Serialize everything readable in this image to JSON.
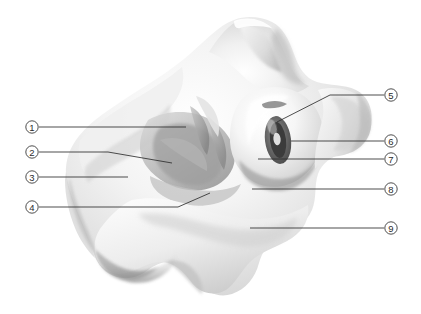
{
  "figure": {
    "background_color": "#ffffff",
    "specimen_tint_light": "#fdfdfd",
    "specimen_tint_mid": "#dcdcdc",
    "specimen_tint_dark": "#9a9a9a",
    "specimen_tint_deep": "#6b6b6b",
    "leader_color": "#2e2e2e",
    "callout_text_color": "#2b2b2b",
    "callout_fill_color": "#ffffff"
  },
  "callouts": [
    {
      "id": 1,
      "label": "1",
      "side": "left",
      "marker_x": 32,
      "marker_y": 127,
      "leader_path": "M 39 127 L 186 127",
      "target_x": 186,
      "target_y": 127
    },
    {
      "id": 2,
      "label": "2",
      "side": "left",
      "marker_x": 32,
      "marker_y": 152,
      "leader_path": "M 39 152 L 108 152 L 172 163",
      "target_x": 172,
      "target_y": 163
    },
    {
      "id": 3,
      "label": "3",
      "side": "left",
      "marker_x": 32,
      "marker_y": 177,
      "leader_path": "M 39 177 L 128 177",
      "target_x": 128,
      "target_y": 177
    },
    {
      "id": 4,
      "label": "4",
      "side": "left",
      "marker_x": 32,
      "marker_y": 207,
      "leader_path": "M 39 207 L 178 207 L 210 193",
      "target_x": 210,
      "target_y": 193
    },
    {
      "id": 5,
      "label": "5",
      "side": "right",
      "marker_x": 391,
      "marker_y": 95,
      "leader_path": "M 384 95 L 330 95 L 277 122",
      "target_x": 277,
      "target_y": 122
    },
    {
      "id": 6,
      "label": "6",
      "side": "right",
      "marker_x": 391,
      "marker_y": 141,
      "leader_path": "M 384 141 L 291 141",
      "target_x": 291,
      "target_y": 141
    },
    {
      "id": 7,
      "label": "7",
      "side": "right",
      "marker_x": 391,
      "marker_y": 159,
      "leader_path": "M 384 159 L 258 159",
      "target_x": 258,
      "target_y": 159
    },
    {
      "id": 8,
      "label": "8",
      "side": "right",
      "marker_x": 391,
      "marker_y": 189,
      "leader_path": "M 384 189 L 252 189",
      "target_x": 252,
      "target_y": 189
    },
    {
      "id": 9,
      "label": "9",
      "side": "right",
      "marker_x": 391,
      "marker_y": 228,
      "leader_path": "M 384 228 L 250 228",
      "target_x": 250,
      "target_y": 228
    }
  ]
}
